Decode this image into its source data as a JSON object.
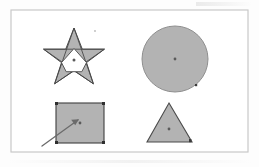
{
  "figure": {
    "page_background": "#fdfdfd",
    "frame": {
      "name": "figure-border",
      "x": 11,
      "y": 10,
      "width": 237,
      "height": 142,
      "stroke": "#c9c9c9",
      "stroke_width": 1.2,
      "fill": "#ffffff"
    },
    "palette": {
      "shape_fill": "#b3b3b3",
      "shape_stroke": "#4a4a4a",
      "center_dot": "#5a5a5a",
      "inner_fill": "#ffffff",
      "arrow": "#6b6b6b",
      "mark": "#3c3c3c"
    },
    "shapes": [
      {
        "id": "star",
        "label": "star",
        "type": "pentagram",
        "center": {
          "x": 74,
          "y": 60
        },
        "outer_radius": 32,
        "inner_radius": 12.5,
        "fill": "#b3b3b3",
        "stroke": "#4a4a4a",
        "inner_fill": "#ffffff",
        "points": "74,28 82.3,49.2 104.4,49.2 86.5,62.6 93.4,83.8 74,70.8 54.6,83.8 61.5,62.6 43.6,49.2 65.7,49.2",
        "centroid_dot": {
          "x": 74,
          "y": 60,
          "r": 1.5
        }
      },
      {
        "id": "circle",
        "label": "circle",
        "type": "circle",
        "center": {
          "x": 175,
          "y": 59
        },
        "radius": 33,
        "fill": "#b3b3b3",
        "stroke": "#8f8f8f",
        "centroid_dot": {
          "x": 175,
          "y": 59,
          "r": 1.4
        },
        "edge_mark": {
          "x": 196,
          "y": 85,
          "w": 2.2,
          "h": 2.2
        }
      },
      {
        "id": "square",
        "label": "square",
        "type": "rect",
        "x": 56,
        "y": 103,
        "width": 48,
        "height": 40,
        "fill": "#b3b3b3",
        "stroke": "#3f3f3f",
        "centroid_dot": {
          "x": 80,
          "y": 123,
          "r": 1.4
        },
        "corner_marks": [
          {
            "x": 56,
            "y": 103
          },
          {
            "x": 104,
            "y": 103
          },
          {
            "x": 56,
            "y": 143
          },
          {
            "x": 104,
            "y": 143
          }
        ],
        "arrow": {
          "name": "pointer-arrow",
          "from": {
            "x": 42,
            "y": 146
          },
          "to": {
            "x": 78,
            "y": 120
          },
          "stroke": "#6b6b6b"
        }
      },
      {
        "id": "triangle",
        "label": "triangle",
        "type": "polygon",
        "points": "169,103 192,142 147,142",
        "fill": "#b3b3b3",
        "stroke": "#4a4a4a",
        "centroid_dot": {
          "x": 169,
          "y": 129,
          "r": 1.4
        }
      }
    ],
    "speck": {
      "x": 95,
      "y": 31,
      "r": 0.9,
      "color": "#b9b9b9"
    }
  }
}
